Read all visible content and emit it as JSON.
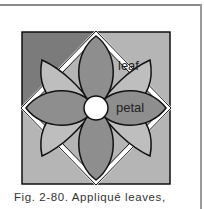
{
  "figure": {
    "labels": {
      "leaf": "leaf",
      "petal": "petal"
    },
    "colors": {
      "background_dark": "#7b7b7b",
      "background_light": "#b5b5b5",
      "petal": "#8e8e8e",
      "leaf": "#bebebe",
      "center": "#ffffff",
      "outline": "#111111"
    }
  },
  "caption": {
    "text": "Fig. 2-80. Appliqué leaves,"
  }
}
